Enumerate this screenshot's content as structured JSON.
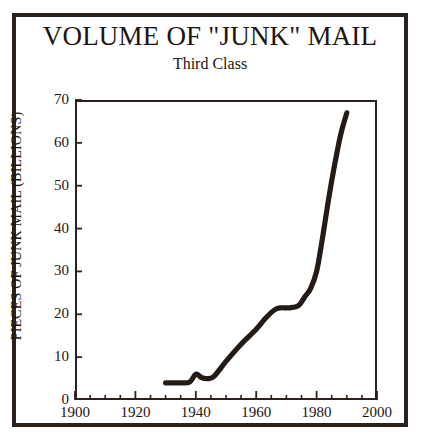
{
  "chart_data": {
    "type": "line",
    "title": "VOLUME OF \"JUNK\" MAIL",
    "subtitle": "Third Class",
    "xlabel": "",
    "ylabel": "PIECES OF JUNK MAIL (BILLIONS)",
    "xlim": [
      1900,
      2000
    ],
    "ylim": [
      0,
      70
    ],
    "x_ticks": [
      1900,
      1920,
      1940,
      1960,
      1980,
      2000
    ],
    "x_tick_labels": [
      "1900",
      "1920",
      "1940",
      "1960",
      "1980",
      "2000"
    ],
    "x_minor_tick_step": 5,
    "y_ticks": [
      0,
      10,
      20,
      30,
      40,
      50,
      60,
      70
    ],
    "y_tick_labels": [
      "0",
      "10",
      "20",
      "30",
      "40",
      "50",
      "60",
      "70"
    ],
    "grid": false,
    "legend": null,
    "series": [
      {
        "name": "Third class junk mail volume",
        "x": [
          1930,
          1935,
          1938,
          1940,
          1942,
          1944,
          1946,
          1950,
          1955,
          1960,
          1963,
          1966,
          1968,
          1971,
          1974,
          1976,
          1978,
          1980,
          1982,
          1984,
          1986,
          1988,
          1990
        ],
        "values": [
          4,
          4,
          4.2,
          6,
          5.2,
          5,
          5.5,
          9,
          13,
          16.5,
          19,
          21,
          21.5,
          21.5,
          22,
          24,
          26,
          30,
          38,
          47,
          55,
          62,
          67
        ]
      }
    ],
    "line_color": "#241b17",
    "frame_color": "#2b211d",
    "background_color": "#ffffff"
  }
}
